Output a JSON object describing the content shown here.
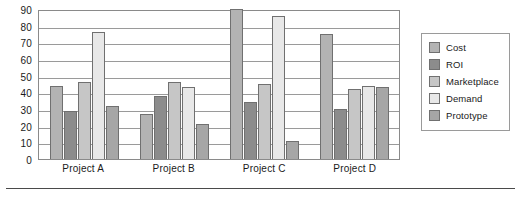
{
  "chart_data": {
    "type": "bar",
    "title": "",
    "subtitle": "",
    "xlabel": "",
    "ylabel": "",
    "ylim": [
      0,
      90
    ],
    "ytick_step": 10,
    "yticks": [
      0,
      10,
      20,
      30,
      40,
      50,
      60,
      70,
      80,
      90
    ],
    "ytick_labels": [
      "0",
      "10",
      "20",
      "30",
      "40",
      "50",
      "60",
      "70",
      "80",
      "90"
    ],
    "grid": true,
    "grid_axis": "y",
    "legend_position": "right",
    "categories": [
      "Project A",
      "Project B",
      "Project C",
      "Project D"
    ],
    "series": [
      {
        "name": "Cost",
        "color": "#b3b3b3",
        "values": [
          44,
          27,
          90,
          75
        ]
      },
      {
        "name": "ROI",
        "color": "#8c8c8c",
        "values": [
          29,
          38,
          34,
          30
        ]
      },
      {
        "name": "Marketplace",
        "color": "#c6c6c6",
        "values": [
          46,
          46,
          45,
          42
        ]
      },
      {
        "name": "Demand",
        "color": "#e8e8e8",
        "values": [
          76,
          43,
          86,
          44
        ]
      },
      {
        "name": "Prototype",
        "color": "#a6a6a6",
        "values": [
          32,
          21,
          11,
          43
        ]
      }
    ]
  },
  "colors": {
    "plot_border": "#8a8a8a",
    "gridline": "#9a9a9a",
    "bar_border": "#707070",
    "legend_border": "#9a9a9a",
    "text": "#1a1a1a",
    "bottom_rule": "#4a4a4a",
    "background": "#ffffff"
  }
}
